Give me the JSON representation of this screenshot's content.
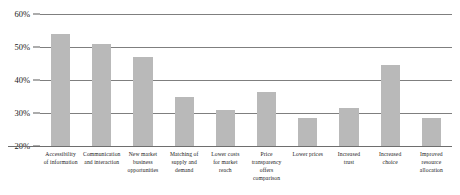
{
  "chart_data": {
    "type": "bar",
    "title": "",
    "xlabel": "",
    "ylabel": "",
    "ylim": [
      20,
      60
    ],
    "ytick_labels": [
      "60%",
      "50%",
      "40%",
      "30%",
      "20%"
    ],
    "ytick_values": [
      60,
      50,
      40,
      30,
      20
    ],
    "grid": true,
    "legend": "none",
    "bar_color": "#b9b9b9",
    "gridline_color": "#7f7f7f",
    "background_color": "#ffffff",
    "categories": [
      "Accessibility of information",
      "Communication and interaction",
      "New market business opportunities",
      "Matching of supply and demand",
      "Lower costs for market reach",
      "Price transparency offers comparison",
      "Lower prices",
      "Increased trust",
      "Increased choice",
      "Improved resource allocation"
    ],
    "category_lines": [
      [
        "Accessibility",
        "of information"
      ],
      [
        "Communication",
        "and interaction"
      ],
      [
        "New market",
        "business",
        "opportunities"
      ],
      [
        "Matching of",
        "supply and",
        "demand"
      ],
      [
        "Lower costs",
        "for market",
        "reach"
      ],
      [
        "Price",
        "transparency",
        "offers",
        "comparison"
      ],
      [
        "Lower prices"
      ],
      [
        "Increased",
        "trust"
      ],
      [
        "Increased",
        "choice"
      ],
      [
        "Improved",
        "resource",
        "allocation"
      ]
    ],
    "values": [
      54,
      51,
      47,
      35,
      31,
      36.5,
      28.5,
      31.5,
      44.5,
      28.5
    ]
  }
}
